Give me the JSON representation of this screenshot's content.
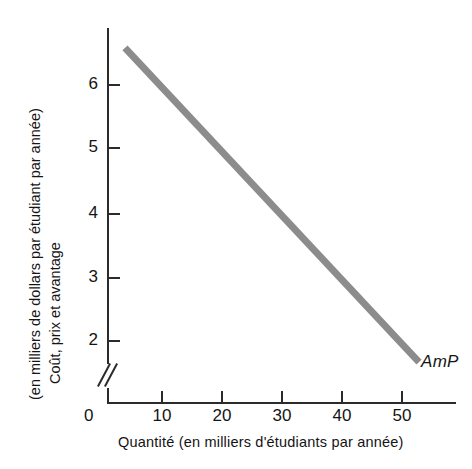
{
  "chart_data": {
    "type": "line",
    "title": "",
    "subtitle": "",
    "xlabel": "Quantité (en milliers d'étudiants par année)",
    "ylabel_line1": "Coût, prix et avantage",
    "ylabel_line2": "(en milliers de dollars par étudiant par année)",
    "ylabel": "Coût, prix et avantage (en milliers de dollars par étudiant par année)",
    "xlim": [
      0,
      58
    ],
    "ylim": [
      1.55,
      7.0
    ],
    "xticks": [
      10,
      20,
      30,
      40,
      50
    ],
    "xtick_labels": [
      "10",
      "20",
      "30",
      "40",
      "50"
    ],
    "yticks": [
      2,
      3,
      4,
      5,
      6
    ],
    "ytick_labels": [
      "2",
      "3",
      "4",
      "5",
      "6"
    ],
    "origin_label": "0",
    "grid": false,
    "legend": "none",
    "y_axis_break": true,
    "series": [
      {
        "name": "AmP",
        "label": "AmP",
        "color": "#8c8c8c",
        "linewidth": 7,
        "x": [
          4,
          53
        ],
        "values": [
          6.6,
          1.65
        ],
        "annotation": "AmP",
        "annotation_x": 53,
        "annotation_y": 1.75
      }
    ],
    "axis_color": "#2b2b2b"
  }
}
